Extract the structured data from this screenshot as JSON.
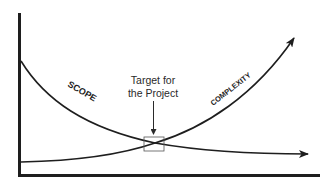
{
  "diagram": {
    "type": "scope-vs-complexity",
    "curves": {
      "scope": {
        "label": "SCOPE",
        "trend": "decreasing"
      },
      "complexity": {
        "label": "COMPLEXITY",
        "trend": "increasing"
      }
    },
    "annotation": {
      "line1": "Target for",
      "line2": "the Project"
    },
    "colors": {
      "ink": "#1e1e1e",
      "background": "#ffffff",
      "target_box": "#555555"
    }
  }
}
